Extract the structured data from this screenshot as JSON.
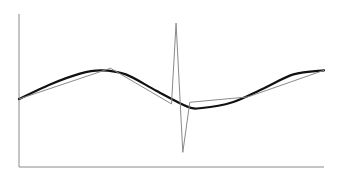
{
  "chart_data": {
    "type": "line",
    "title": "",
    "xlabel": "",
    "ylabel": "",
    "grid": false,
    "legend": null,
    "axes": {
      "x_ticks": [],
      "y_ticks": []
    },
    "colors": {
      "smooth": "#111111",
      "noisy": "#8a8a8a",
      "axis": "#8a8a8a"
    },
    "series": [
      {
        "name": "smooth-curve",
        "style": "thick",
        "points": [
          [
            0,
            0
          ],
          [
            0.1,
            0.35
          ],
          [
            0.2,
            0.62
          ],
          [
            0.27,
            0.7
          ],
          [
            0.35,
            0.6
          ],
          [
            0.45,
            0.2
          ],
          [
            0.55,
            -0.18
          ],
          [
            0.6,
            -0.22
          ],
          [
            0.7,
            -0.08
          ],
          [
            0.8,
            0.25
          ],
          [
            0.9,
            0.6
          ],
          [
            1.0,
            0.7
          ]
        ]
      },
      {
        "name": "noisy-polyline",
        "style": "thin",
        "points": [
          [
            0,
            0
          ],
          [
            0.3,
            0.75
          ],
          [
            0.5,
            -0.12
          ],
          [
            0.515,
            1.85
          ],
          [
            0.537,
            -1.3
          ],
          [
            0.56,
            -0.08
          ],
          [
            0.75,
            0.05
          ],
          [
            1.0,
            0.7
          ]
        ]
      }
    ],
    "ylim": [
      -1.7,
      2.2
    ],
    "xlim": [
      0,
      1
    ]
  }
}
